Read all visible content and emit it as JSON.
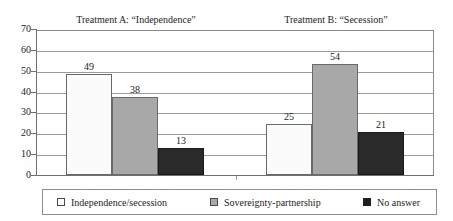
{
  "chart_data": {
    "type": "bar",
    "title": "",
    "subtitle": "",
    "xlabel": "",
    "ylabel": "",
    "ylim": [
      0,
      70
    ],
    "yticks": [
      0,
      10,
      20,
      30,
      40,
      50,
      60,
      70
    ],
    "grid": true,
    "legend_position": "bottom",
    "categories": [
      "Treatment A: “Independence”",
      "Treatment B: “Secession”"
    ],
    "series": [
      {
        "name": "Independence/secession",
        "values": [
          49,
          25
        ],
        "color": "#ffffff"
      },
      {
        "name": "Sovereignty-partnership",
        "values": [
          38,
          54
        ],
        "color": "#a8a8a8"
      },
      {
        "name": "No answer",
        "values": [
          13,
          21
        ],
        "color": "#1f1f1f"
      }
    ],
    "data_labels": [
      [
        "49",
        "38",
        "13"
      ],
      [
        "25",
        "54",
        "21"
      ]
    ]
  },
  "groups": [
    {
      "title": "Treatment A: “Independence”"
    },
    {
      "title": "Treatment B: “Secession”"
    }
  ],
  "axis": {
    "y_tick_labels": [
      "70",
      "60",
      "50",
      "40",
      "30",
      "20",
      "10",
      "0"
    ]
  },
  "legend": {
    "entries": [
      {
        "label": "Independence/secession"
      },
      {
        "label": "Sovereignty-partnership"
      },
      {
        "label": "No answer"
      }
    ]
  }
}
